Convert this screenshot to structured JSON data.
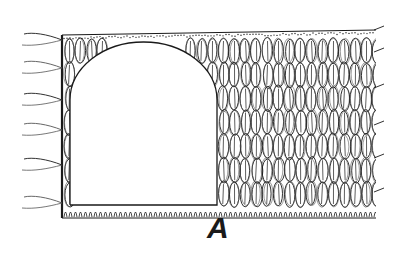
{
  "figure": {
    "label": "A",
    "colors": {
      "ink": "#1a1a1a",
      "paper": "#ffffff",
      "ink_light": "#555555"
    }
  },
  "fabric": {
    "outer": {
      "left": 62,
      "top_left": 35,
      "top_right": 30,
      "right": 376,
      "bottom": 218
    },
    "opening": {
      "left": 70,
      "right": 217,
      "top": 42,
      "bottom": 205,
      "arch_spring": 100
    },
    "stitch_rows": 7,
    "stitch_width": 11
  },
  "fringe": {
    "left_strands": [
      {
        "y": 40
      },
      {
        "y": 68
      },
      {
        "y": 100
      },
      {
        "y": 130
      },
      {
        "y": 165
      },
      {
        "y": 203
      }
    ],
    "right_ticks": [
      {
        "y": 30
      },
      {
        "y": 52
      },
      {
        "y": 88
      },
      {
        "y": 125
      },
      {
        "y": 158
      },
      {
        "y": 192
      }
    ]
  }
}
